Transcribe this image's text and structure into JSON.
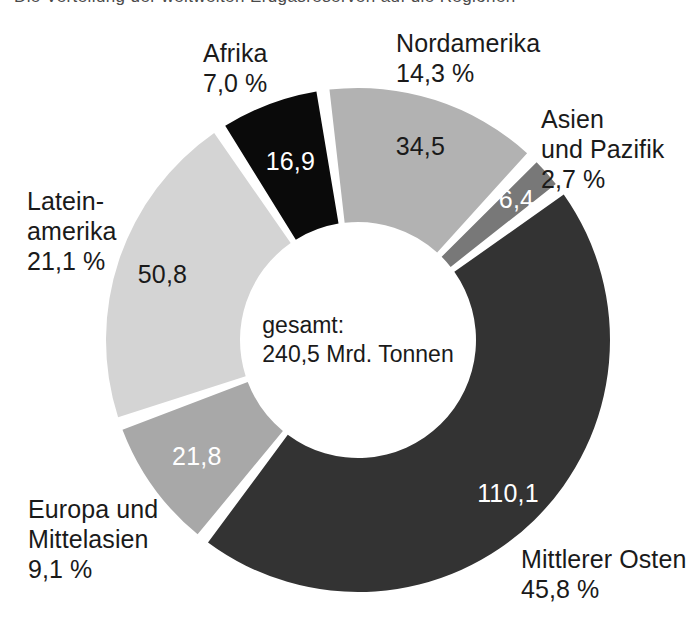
{
  "page": {
    "top_cut_text": "Die Verteilung der weltweiten Erdgasreserven auf die Regionen",
    "background_color": "#ffffff"
  },
  "center": {
    "line1": "gesamt:",
    "line2": "240,5 Mrd. Tonnen"
  },
  "chart_data": {
    "type": "pie",
    "title": "",
    "subtitle": "",
    "donut": true,
    "center_label": "gesamt: 240,5 Mrd. Tonnen",
    "total_value": 240.5,
    "unit": "Mrd. Tonnen",
    "value_format": "de-DE comma decimal",
    "legend_position": "outside-labels",
    "start_angle_deg": -8,
    "direction": "clockwise",
    "categories": [
      "Nordamerika",
      "Asien und Pazifik",
      "Mittlerer Osten",
      "Europa und Mittelasien",
      "Lateinamerika",
      "Afrika"
    ],
    "values": [
      34.5,
      6.4,
      110.1,
      21.8,
      50.8,
      16.9
    ],
    "percentages": [
      14.3,
      2.7,
      45.8,
      9.1,
      21.1,
      7.0
    ],
    "value_labels": [
      "34,5",
      "6,4",
      "110,1",
      "21,8",
      "50,8",
      "16,9"
    ],
    "percent_labels": [
      "14,3 %",
      "2,7 %",
      "45,8 %",
      "9,1 %",
      "21,1 %",
      "7,0 %"
    ],
    "colors": [
      "#b2b2b2",
      "#787878",
      "#333333",
      "#a8a8a8",
      "#d4d4d4",
      "#0a0a0a"
    ],
    "slices": [
      {
        "name": "Nordamerika",
        "label_line1": "Nordamerika",
        "label_line2": "14,3 %",
        "value_label": "34,5",
        "value": 34.5,
        "percent": 14.3,
        "color": "#b2b2b2",
        "value_text_color": "#1a1a1a"
      },
      {
        "name": "Asien und Pazifik",
        "label_line1": "Asien",
        "label_line2": "und Pazifik",
        "label_line3": "2,7 %",
        "value_label": "6,4",
        "value": 6.4,
        "percent": 2.7,
        "color": "#787878",
        "value_text_color": "#ffffff"
      },
      {
        "name": "Mittlerer Osten",
        "label_line1": "Mittlerer Osten",
        "label_line2": "45,8 %",
        "value_label": "110,1",
        "value": 110.1,
        "percent": 45.8,
        "color": "#333333",
        "value_text_color": "#ffffff"
      },
      {
        "name": "Europa und Mittelasien",
        "label_line1": "Europa und",
        "label_line2": "Mittelasien",
        "label_line3": "9,1 %",
        "value_label": "21,8",
        "value": 21.8,
        "percent": 9.1,
        "color": "#a8a8a8",
        "value_text_color": "#ffffff"
      },
      {
        "name": "Lateinamerika",
        "label_line1": "Latein-",
        "label_line2": "amerika",
        "label_line3": "21,1 %",
        "value_label": "50,8",
        "value": 50.8,
        "percent": 21.1,
        "color": "#d4d4d4",
        "value_text_color": "#1a1a1a"
      },
      {
        "name": "Afrika",
        "label_line1": "Afrika",
        "label_line2": "7,0 %",
        "value_label": "16,9",
        "value": 16.9,
        "percent": 7.0,
        "color": "#0a0a0a",
        "value_text_color": "#ffffff"
      }
    ]
  }
}
